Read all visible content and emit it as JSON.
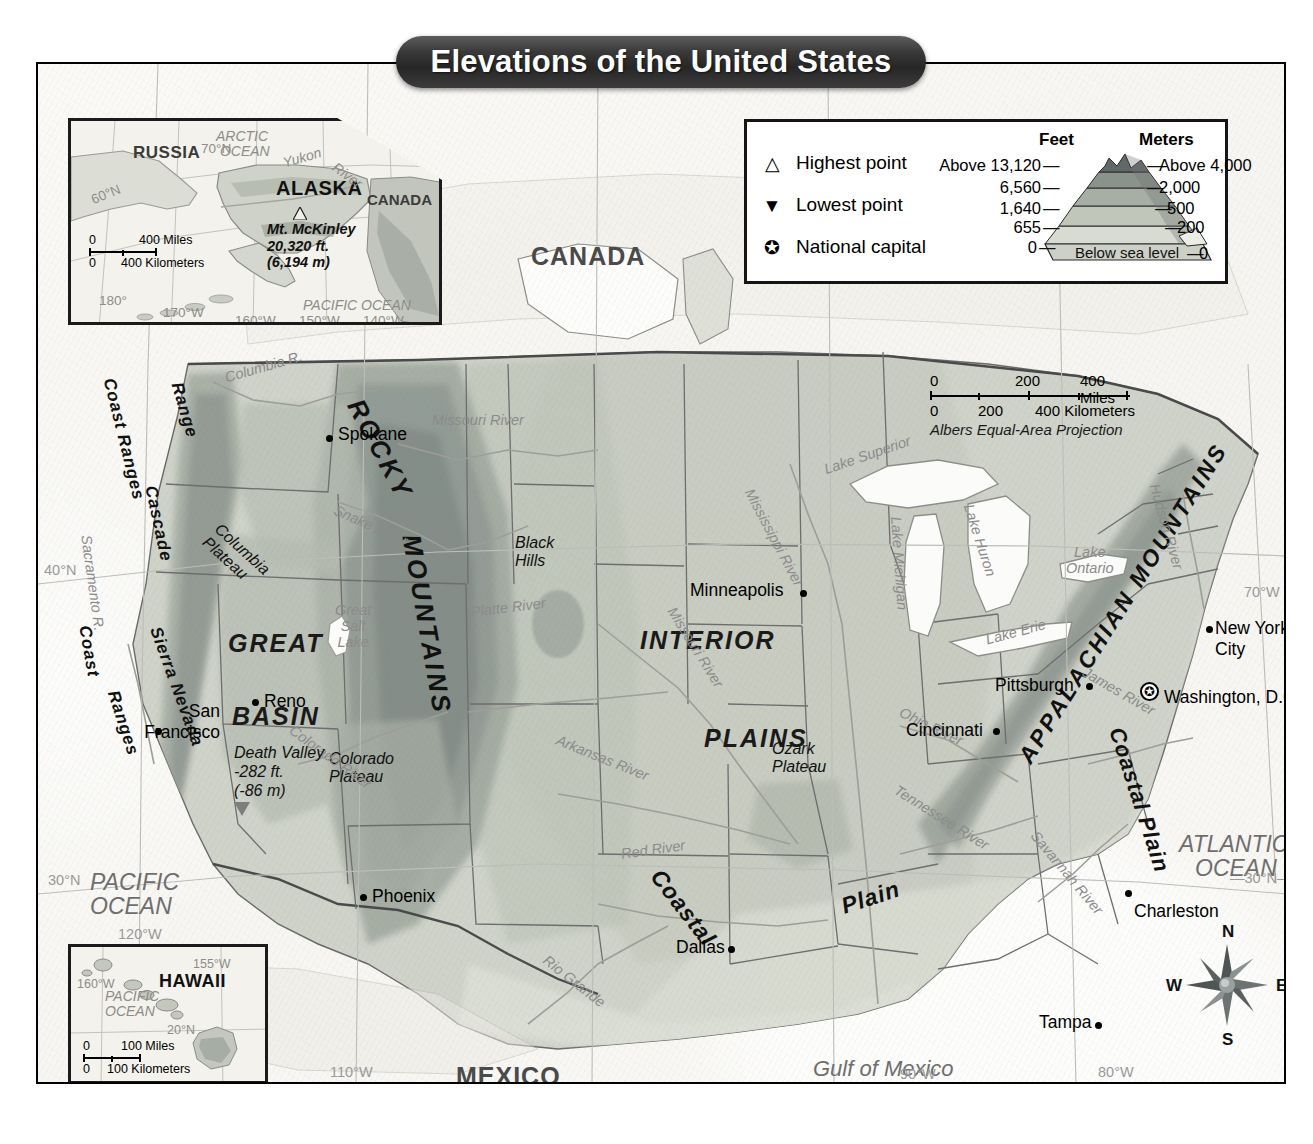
{
  "title": "Elevations of the United States",
  "legend": {
    "entries": [
      {
        "symbol": "△",
        "label": "Highest point",
        "name": "highest-point"
      },
      {
        "symbol": "▼",
        "label": "Lowest point",
        "name": "lowest-point"
      },
      {
        "symbol": "✪",
        "label": "National capital",
        "name": "national-capital"
      }
    ],
    "pyramid": {
      "feet_header": "Feet",
      "meters_header": "Meters",
      "feet_values": [
        "Above 13,120",
        "6,560",
        "1,640",
        "655",
        "0"
      ],
      "meters_values": [
        "Above 4,000",
        "2,000",
        "500",
        "200",
        "0"
      ],
      "below_sea_level": "Below sea level",
      "band_colors": [
        "#5c6363",
        "#7d8682",
        "#9aa29b",
        "#b5bbb1",
        "#c9cdc3",
        "#d8dbd2"
      ]
    }
  },
  "scale_main": {
    "miles": {
      "zero": "0",
      "mid": "200",
      "max": "400 Miles"
    },
    "kilometers": {
      "zero": "0",
      "mid": "200",
      "max": "400 Kilometers"
    },
    "projection": "Albers Equal-Area Projection"
  },
  "compass": {
    "n": "N",
    "e": "E",
    "s": "S",
    "w": "W"
  },
  "alaska_inset": {
    "title": "ALASKA",
    "neighbors": [
      "RUSSIA",
      "CANADA"
    ],
    "oceans": [
      "ARCTIC OCEAN",
      "PACIFIC OCEAN"
    ],
    "rivers": [
      "Yukon",
      "River"
    ],
    "highest_point": {
      "name": "Mt. McKinley",
      "feet": "20,320 ft.",
      "meters": "(6,194 m)",
      "symbol": "△"
    },
    "graticule": [
      "70°N",
      "60°N",
      "180°",
      "170°W",
      "160°W",
      "150°W",
      "140°W"
    ],
    "scale": {
      "miles": "400 Miles",
      "kilometers": "400 Kilometers",
      "zero": "0"
    }
  },
  "hawaii_inset": {
    "title": "HAWAII",
    "ocean": "PACIFIC OCEAN",
    "graticule": [
      "155°W",
      "160°W",
      "20°N"
    ],
    "scale": {
      "miles": "100 Miles",
      "kilometers": "100 Kilometers",
      "zero": "0"
    }
  },
  "countries": [
    {
      "name": "CANADA",
      "x": 493,
      "y": 192
    },
    {
      "name": "MEXICO",
      "x": 418,
      "y": 1012
    }
  ],
  "oceans": [
    {
      "name": "PACIFIC",
      "name2": "OCEAN",
      "x": 52,
      "y": 818
    },
    {
      "name": "ATLANTIC",
      "name2": "OCEAN",
      "x": 1181,
      "y": 780
    },
    {
      "name": "Gulf of Mexico",
      "x": 812,
      "y": 1005
    }
  ],
  "cities": [
    {
      "name": "Spokane",
      "lx": 300,
      "ly": 367,
      "dx": 288,
      "dy": 374
    },
    {
      "name": "Minneapolis",
      "lx": 652,
      "ly": 522,
      "dx": 762,
      "dy": 529
    },
    {
      "name": "Reno",
      "lx": 226,
      "ly": 633,
      "dx": 214,
      "dy": 638
    },
    {
      "name": "San",
      "name2": "Francisco",
      "lx": 116,
      "ly": 643,
      "dx": 117,
      "dy": 672
    },
    {
      "name": "Phoenix",
      "lx": 334,
      "ly": 829,
      "dx": 322,
      "dy": 836
    },
    {
      "name": "Dallas",
      "lx": 638,
      "ly": 880,
      "dx": 690,
      "dy": 886
    },
    {
      "name": "Cincinnati",
      "lx": 868,
      "ly": 662,
      "dx": 955,
      "dy": 668
    },
    {
      "name": "Pittsburgh",
      "lx": 957,
      "ly": 617,
      "dx": 1048,
      "dy": 622
    },
    {
      "name": "New York",
      "name2": "City",
      "lx": 1177,
      "ly": 560,
      "dx": 1168,
      "dy": 566
    },
    {
      "name": "Charleston",
      "lx": 1096,
      "ly": 843,
      "dx": 1090,
      "dy": 832
    },
    {
      "name": "Tampa",
      "lx": 1001,
      "ly": 954,
      "dx": 1057,
      "dy": 961
    },
    {
      "name": "Washington, D.C.",
      "lx": 1124,
      "ly": 630,
      "dx": 0,
      "dy": 0
    }
  ],
  "capital": {
    "name": "Washington, D.C.",
    "symbol": "✪",
    "x": 1110,
    "y": 628
  },
  "lowest_point": {
    "name": "Death Valley",
    "feet": "-282 ft.",
    "meters": "(-86 m)",
    "x": 234,
    "y": 701
  },
  "physical_regions": [
    {
      "name": "GREAT",
      "x": 226,
      "y": 579
    },
    {
      "name": "BASIN",
      "x": 233,
      "y": 652
    },
    {
      "name": "INTERIOR",
      "x": 754,
      "y": 624
    },
    {
      "name": "PLAINS",
      "x": 800,
      "y": 722
    }
  ],
  "mountain_ranges": [
    {
      "name": "ROCKY",
      "type": "big"
    },
    {
      "name": "MOUNTAINS",
      "type": "big"
    },
    {
      "name": "APPALACHIAN MOUNTAINS",
      "type": "big"
    },
    {
      "name": "Coast Ranges",
      "type": "range"
    },
    {
      "name": "Cascade",
      "type": "range"
    },
    {
      "name": "Range",
      "type": "range"
    },
    {
      "name": "Coast",
      "type": "range"
    },
    {
      "name": "Ranges",
      "type": "range"
    },
    {
      "name": "Sierra Nevada",
      "type": "range"
    },
    {
      "name": "Coastal",
      "type": "range"
    },
    {
      "name": "Plain",
      "type": "range"
    },
    {
      "name": "Coastal Plain",
      "type": "range"
    }
  ],
  "features": [
    {
      "name": "Columbia",
      "name2": "Plateau",
      "x": 220,
      "y": 525
    },
    {
      "name": "Black",
      "name2": "Hills",
      "x": 513,
      "y": 540
    },
    {
      "name": "Colorado",
      "name2": "Plateau",
      "x": 327,
      "y": 757
    },
    {
      "name": "Ozark",
      "name2": "Plateau",
      "x": 770,
      "y": 746
    },
    {
      "name": "Great",
      "name2": "Salt",
      "name3": "Lake",
      "x": 333,
      "y": 608
    }
  ],
  "rivers": [
    "Columbia R.",
    "Snake River",
    "Missouri River",
    "Sacramento R.",
    "Colorado River",
    "Platte River",
    "Mississippi River",
    "Missouri River",
    "Arkansas River",
    "Red River",
    "Rio Grande",
    "Ohio River",
    "Tennessee River",
    "Savannah River",
    "James River",
    "Hudson River"
  ],
  "lakes": [
    "Lake Superior",
    "Lake Michigan",
    "Lake Huron",
    "Lake Erie",
    "Lake Ontario"
  ],
  "graticule": [
    "40°N",
    "30°N",
    "30°N",
    "120°W",
    "110°W",
    "90°W",
    "80°W",
    "70°W"
  ],
  "colors": {
    "elev_lowest": "#d8dbd2",
    "elev_low": "#c9cdc3",
    "elev_mid": "#b5bbb1",
    "elev_high": "#9aa29b",
    "elev_higher": "#7d8682",
    "elev_highest": "#5c6363",
    "ocean": "#fbfaf7",
    "border": "#5a5a5a",
    "banner": "#2b2b2b"
  }
}
